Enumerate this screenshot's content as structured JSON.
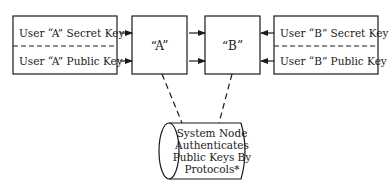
{
  "diagram": {
    "left_keys": {
      "secret": "User “A” Secret Key",
      "public": "User “A” Public Key"
    },
    "node_a": "“A”",
    "node_b": "“B”",
    "right_keys": {
      "secret": "User “B” Secret Key",
      "public": "User “B” Public Key"
    },
    "system_node": {
      "lines": [
        "System Node",
        "Authenticates",
        "Public Keys By",
        "Protocols*"
      ]
    },
    "colors": {
      "stroke": "#1a1a1a",
      "background": "#ffffff"
    }
  }
}
